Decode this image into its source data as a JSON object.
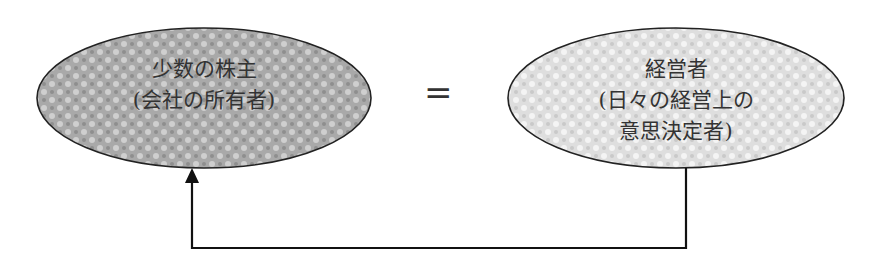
{
  "diagram": {
    "left_node": {
      "lines": [
        "少数の株主",
        "(会社の所有者)"
      ],
      "fill": "#a8a8a8"
    },
    "relation": "=",
    "right_node": {
      "lines": [
        "経営者",
        "(日々の経営上の",
        "意思決定者)"
      ],
      "fill": "#dcdcdc"
    },
    "connector": {
      "from": "right_node",
      "to": "left_node",
      "style": "elbow arrow"
    }
  }
}
